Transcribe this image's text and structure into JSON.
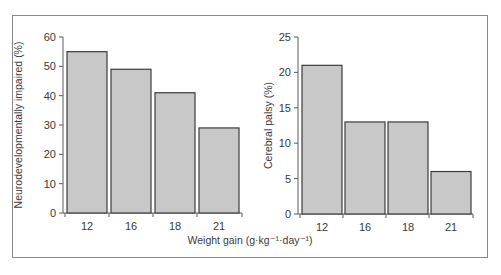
{
  "chart_data": [
    {
      "type": "bar",
      "title": "",
      "categories": [
        "12",
        "16",
        "18",
        "21"
      ],
      "values": [
        55,
        49,
        41,
        29
      ],
      "xlabel": "Weight gain (g·kg⁻¹·day⁻¹)",
      "ylabel": "Neurodevelopmentally impaired (%)",
      "ylim": [
        0,
        60
      ],
      "yticks": [
        0,
        10,
        20,
        30,
        40,
        50,
        60
      ],
      "grid": false,
      "bar_color": "#c8c8c8",
      "bar_edge_color": "#3c3c3c"
    },
    {
      "type": "bar",
      "title": "",
      "categories": [
        "12",
        "16",
        "18",
        "21"
      ],
      "values": [
        21,
        13,
        13,
        6
      ],
      "xlabel": "Weight gain (g·kg⁻¹·day⁻¹)",
      "ylabel": "Cerebral palsy (%)",
      "ylim": [
        0,
        25
      ],
      "yticks": [
        0,
        5,
        10,
        15,
        20,
        25
      ],
      "grid": false,
      "bar_color": "#c8c8c8",
      "bar_edge_color": "#3c3c3c"
    }
  ],
  "shared_xlabel": "Weight gain (g·kg⁻¹·day⁻¹)"
}
